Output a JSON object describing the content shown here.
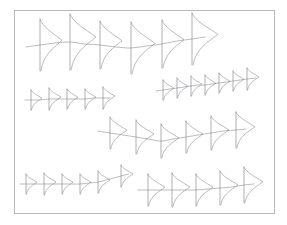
{
  "figure": {
    "title": "",
    "background_color": "#ffffff",
    "width": 287,
    "height": 225
  },
  "frame": {
    "name": "plot-frame",
    "x": 14,
    "y": 10,
    "width": 260,
    "height": 203,
    "stroke_color": "#b8b8b8",
    "stroke_width": 1
  },
  "style": {
    "line_color": "#8e8e96",
    "line_width": 0.6,
    "stem_color": "#7a7a84",
    "stem_width": 0.6,
    "density_color": "#8e8e96",
    "density_width": 0.6
  },
  "chart_data": {
    "type": "line",
    "title": "",
    "subtitle": "",
    "xlabel": "",
    "ylabel": "",
    "xlim": [
      14,
      274
    ],
    "ylim": [
      10,
      213
    ],
    "grid": false,
    "legend": "none",
    "axis_ticks": [],
    "tick_labels": [],
    "annotations": [],
    "series": [
      {
        "name": "series-1",
        "glyph_count": 6,
        "glyph_scale": 1.0,
        "x": [
          40,
          70,
          100,
          131,
          162,
          192
        ],
        "y": [
          45,
          42,
          45,
          48,
          44,
          39
        ],
        "half_height": [
          26,
          28,
          24,
          26,
          24,
          26
        ],
        "width": [
          22,
          26,
          22,
          24,
          22,
          26
        ],
        "line_path": [
          [
            26,
            47
          ],
          [
            40,
            45
          ],
          [
            55,
            43
          ],
          [
            70,
            42
          ],
          [
            85,
            44
          ],
          [
            100,
            45
          ],
          [
            116,
            47
          ],
          [
            131,
            48
          ],
          [
            146,
            46
          ],
          [
            162,
            44
          ],
          [
            177,
            41
          ],
          [
            192,
            39
          ],
          [
            205,
            37
          ]
        ]
      },
      {
        "name": "series-2",
        "glyph_count": 7,
        "glyph_scale": 0.45,
        "x": [
          163,
          177,
          191,
          205,
          219,
          233,
          247
        ],
        "y": [
          90,
          88,
          86,
          85,
          83,
          81,
          79
        ],
        "half_height": [
          10,
          10,
          10,
          10,
          10,
          10,
          11
        ],
        "width": [
          11,
          11,
          11,
          11,
          11,
          11,
          12
        ],
        "line_path": [
          [
            156,
            91
          ],
          [
            163,
            90
          ],
          [
            170,
            89
          ],
          [
            177,
            88
          ],
          [
            184,
            87
          ],
          [
            191,
            86
          ],
          [
            198,
            85
          ],
          [
            205,
            85
          ],
          [
            212,
            84
          ],
          [
            219,
            83
          ],
          [
            226,
            82
          ],
          [
            233,
            81
          ],
          [
            240,
            80
          ],
          [
            247,
            79
          ],
          [
            256,
            78
          ]
        ]
      },
      {
        "name": "series-3",
        "glyph_count": 5,
        "glyph_scale": 0.45,
        "x": [
          31,
          49,
          67,
          85,
          103
        ],
        "y": [
          100,
          99,
          99,
          99,
          98
        ],
        "half_height": [
          10,
          11,
          10,
          10,
          11
        ],
        "width": [
          11,
          12,
          11,
          11,
          12
        ],
        "line_path": [
          [
            25,
            100
          ],
          [
            31,
            100
          ],
          [
            40,
            100
          ],
          [
            49,
            99
          ],
          [
            58,
            99
          ],
          [
            67,
            99
          ],
          [
            76,
            99
          ],
          [
            85,
            99
          ],
          [
            94,
            98
          ],
          [
            103,
            98
          ],
          [
            110,
            98
          ]
        ]
      },
      {
        "name": "series-4",
        "glyph_count": 6,
        "glyph_scale": 0.72,
        "x": [
          110,
          136,
          161,
          186,
          211,
          236
        ],
        "y": [
          133,
          137,
          141,
          137,
          133,
          130
        ],
        "half_height": [
          16,
          17,
          17,
          16,
          17,
          18
        ],
        "width": [
          17,
          18,
          18,
          17,
          18,
          19
        ],
        "line_path": [
          [
            98,
            131
          ],
          [
            110,
            133
          ],
          [
            123,
            135
          ],
          [
            136,
            137
          ],
          [
            148,
            139
          ],
          [
            161,
            141
          ],
          [
            173,
            139
          ],
          [
            186,
            137
          ],
          [
            198,
            135
          ],
          [
            211,
            133
          ],
          [
            223,
            131
          ],
          [
            236,
            130
          ],
          [
            246,
            129
          ]
        ]
      },
      {
        "name": "series-5",
        "glyph_count": 6,
        "glyph_scale": 0.46,
        "x": [
          26,
          44,
          62,
          80,
          98,
          121
        ],
        "y": [
          184,
          184,
          184,
          184,
          182,
          176
        ],
        "half_height": [
          10,
          11,
          10,
          10,
          11,
          11
        ],
        "width": [
          11,
          12,
          11,
          11,
          12,
          12
        ],
        "line_path": [
          [
            20,
            184
          ],
          [
            26,
            184
          ],
          [
            35,
            184
          ],
          [
            44,
            184
          ],
          [
            53,
            184
          ],
          [
            62,
            184
          ],
          [
            71,
            184
          ],
          [
            80,
            184
          ],
          [
            89,
            183
          ],
          [
            98,
            182
          ],
          [
            110,
            179
          ],
          [
            121,
            176
          ],
          [
            129,
            174
          ]
        ]
      },
      {
        "name": "series-6",
        "glyph_count": 5,
        "glyph_scale": 0.72,
        "x": [
          148,
          172,
          196,
          220,
          244
        ],
        "y": [
          190,
          190,
          190,
          188,
          185
        ],
        "half_height": [
          16,
          17,
          16,
          17,
          18
        ],
        "width": [
          17,
          18,
          17,
          18,
          19
        ],
        "line_path": [
          [
            138,
            190
          ],
          [
            148,
            190
          ],
          [
            160,
            190
          ],
          [
            172,
            190
          ],
          [
            184,
            190
          ],
          [
            196,
            190
          ],
          [
            208,
            189
          ],
          [
            220,
            188
          ],
          [
            232,
            187
          ],
          [
            244,
            185
          ],
          [
            254,
            184
          ]
        ]
      }
    ]
  }
}
